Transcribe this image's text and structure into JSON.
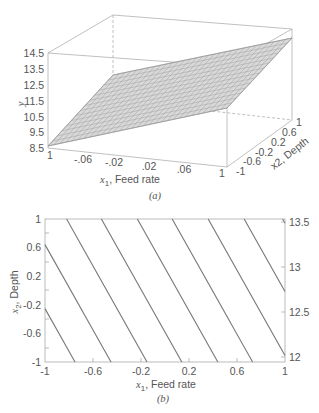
{
  "chart_data": [
    {
      "type": "surface",
      "panel_label": "(a)",
      "title": "",
      "xlabel": "x1, Feed rate",
      "ylabel_depth": "x2, Depth",
      "zlabel": "y",
      "x_ticks": [
        "1",
        "-.06",
        "-.02",
        ".02",
        ".06",
        "1"
      ],
      "depth_ticks": [
        "-1",
        "-0.6",
        "-0.2",
        "0.2",
        "0.6",
        "1"
      ],
      "z_ticks": [
        "8.5",
        "9.5",
        "10.5",
        "11.5",
        "12.5",
        "13.5",
        "14.5"
      ],
      "zlim": [
        8.5,
        14.5
      ],
      "surface_corners": [
        {
          "x1": -1,
          "x2": -1,
          "y": 8.6
        },
        {
          "x1": -1,
          "x2": 1,
          "y": 11.8
        },
        {
          "x1": 1,
          "x2": 1,
          "y": 14.2
        },
        {
          "x1": 1,
          "x2": -1,
          "y": 11.0
        }
      ],
      "grid": "mesh"
    },
    {
      "type": "contour",
      "panel_label": "(b)",
      "title": "",
      "xlabel": "x1, Feed rate",
      "ylabel": "x2, Depth",
      "x_ticks": [
        "-1",
        "-0.6",
        "-0.2",
        "0.2",
        "0.6",
        "1"
      ],
      "y_ticks": [
        "1",
        "0.6",
        "0.2",
        "-0.2",
        "-0.6",
        "-1"
      ],
      "right_axis_ticks": [
        "13.5",
        "13",
        "12.5",
        "12"
      ],
      "xlim": [
        -1,
        1
      ],
      "ylim": [
        -1,
        1
      ],
      "contour_lines_top_x": [
        -0.82,
        -0.53,
        -0.23,
        0.06,
        0.36,
        0.66,
        0.98
      ],
      "contour_line_shift_x": 0.67,
      "left_edge_y": [
        0.78,
        0.06,
        -0.66
      ]
    }
  ],
  "panel_a": {
    "caption": "(a)",
    "xlabel_sym": "x",
    "xlabel_sub": "1",
    "xlabel_text": ", Feed rate",
    "depth_label": "x2, Depth",
    "zlabel": "y",
    "z_ticks": [
      "14.5",
      "13.5",
      "12.5",
      "11.5",
      "10.5",
      "9.5",
      "8.5"
    ],
    "x_ticks": [
      "1",
      "-.06",
      "-.02",
      ".02",
      ".06",
      "1"
    ],
    "depth_ticks": [
      "-1",
      "-0.6",
      "-0.2",
      "0.2",
      "0.6",
      "1"
    ]
  },
  "panel_b": {
    "caption": "(b)",
    "xlabel_sym": "x",
    "xlabel_sub": "1",
    "xlabel_text": ", Feed rate",
    "ylabel_sym": "x",
    "ylabel_sub": "2",
    "ylabel_text": ", Depth",
    "x_ticks": [
      "-1",
      "-0.6",
      "-0.2",
      "0.2",
      "0.6",
      "1"
    ],
    "y_ticks": [
      "1",
      "0.6",
      "0.2",
      "-0.2",
      "-0.6",
      "-1"
    ],
    "right_ticks": [
      "13.5",
      "13",
      "12.5",
      "12"
    ]
  },
  "colors": {
    "axis": "#aaaaaa",
    "surface_line": "#8a8a8a",
    "surface_fill": "#d8d8d8",
    "contour": "#777777",
    "text": "#555555"
  }
}
